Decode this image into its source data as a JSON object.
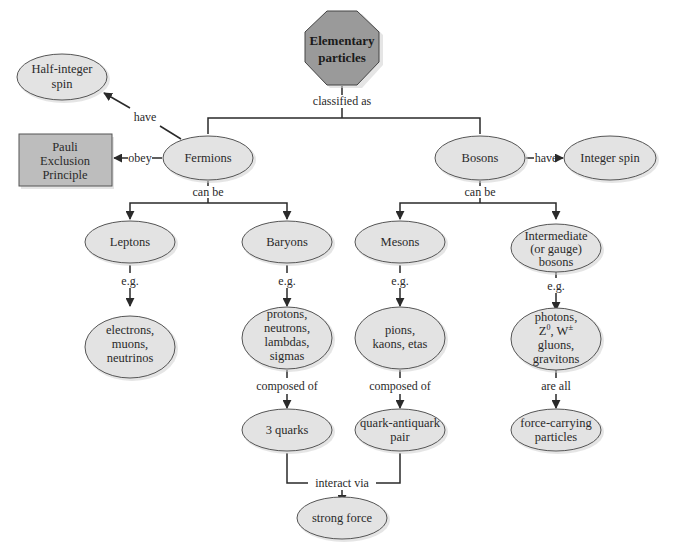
{
  "diagram": {
    "type": "concept-map",
    "colors": {
      "ellipse_fill": "#e3e3e3",
      "root_fill": "#9a9a9a",
      "box_fill": "#bdbdbd",
      "stroke": "#555555",
      "edge": "#2a2a2a"
    },
    "nodes": {
      "root": {
        "lines": [
          "Elementary",
          "particles"
        ],
        "shape": "octagon"
      },
      "half_integer_spin": {
        "lines": [
          "Half-integer",
          "spin"
        ],
        "shape": "ellipse"
      },
      "pauli": {
        "lines": [
          "Pauli",
          "Exclusion",
          "Principle"
        ],
        "shape": "rectangle"
      },
      "fermions": {
        "lines": [
          "Fermions"
        ],
        "shape": "ellipse"
      },
      "bosons": {
        "lines": [
          "Bosons"
        ],
        "shape": "ellipse"
      },
      "integer_spin": {
        "lines": [
          "Integer spin"
        ],
        "shape": "ellipse"
      },
      "leptons": {
        "lines": [
          "Leptons"
        ],
        "shape": "ellipse"
      },
      "baryons": {
        "lines": [
          "Baryons"
        ],
        "shape": "ellipse"
      },
      "mesons": {
        "lines": [
          "Mesons"
        ],
        "shape": "ellipse"
      },
      "intermediate": {
        "lines": [
          "Intermediate",
          "(or gauge)",
          "bosons"
        ],
        "shape": "ellipse"
      },
      "lepton_examples": {
        "lines": [
          "electrons,",
          "muons,",
          "neutrinos"
        ],
        "shape": "ellipse"
      },
      "baryon_examples": {
        "lines": [
          "protons,",
          "neutrons,",
          "lambdas,",
          "sigmas"
        ],
        "shape": "ellipse"
      },
      "meson_examples": {
        "lines": [
          "pions,",
          "kaons, etas"
        ],
        "shape": "ellipse"
      },
      "boson_examples": {
        "line1": "photons,",
        "line2_z": "Z",
        "line2_z_sup": "0",
        "line2_sep": ", ",
        "line2_w": "W",
        "line2_w_sup": "±",
        "line3": "gluons,",
        "line4": "gravitons",
        "shape": "ellipse"
      },
      "three_quarks": {
        "lines": [
          "3 quarks"
        ],
        "shape": "ellipse"
      },
      "quark_antiquark": {
        "lines": [
          "quark-antiquark",
          "pair"
        ],
        "shape": "ellipse"
      },
      "force_carrying": {
        "lines": [
          "force-carrying",
          "particles"
        ],
        "shape": "ellipse"
      },
      "strong_force": {
        "lines": [
          "strong force"
        ],
        "shape": "ellipse"
      }
    },
    "links": {
      "classified_as": "classified as",
      "fermions_have": "have",
      "fermions_obey": "obey",
      "bosons_have": "have",
      "fermions_can_be": "can be",
      "bosons_can_be": "can be",
      "leptons_eg": "e.g.",
      "baryons_eg": "e.g.",
      "mesons_eg": "e.g.",
      "intermediate_eg": "e.g.",
      "baryons_composed_of": "composed of",
      "mesons_composed_of": "composed of",
      "bosons_are_all": "are all",
      "interact_via": "interact via"
    }
  }
}
